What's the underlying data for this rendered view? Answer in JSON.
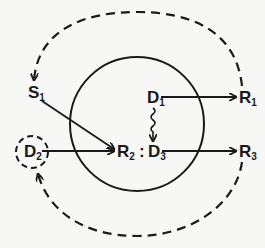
{
  "diagram": {
    "nodes": [
      {
        "id": "S1",
        "letter": "S",
        "sub": "1"
      },
      {
        "id": "D1",
        "letter": "D",
        "sub": "1"
      },
      {
        "id": "R1",
        "letter": "R",
        "sub": "1"
      },
      {
        "id": "D2",
        "letter": "D",
        "sub": "2"
      },
      {
        "id": "R2",
        "letter": "R",
        "sub": "2"
      },
      {
        "id": "D3",
        "letter": "D",
        "sub": "3"
      },
      {
        "id": "R3",
        "letter": "R",
        "sub": "3"
      }
    ],
    "separator": ":",
    "edges": [
      {
        "from": "S1",
        "to": "R2",
        "style": "solid",
        "arrow": true
      },
      {
        "from": "D1",
        "to": "R1",
        "style": "solid",
        "arrow": true
      },
      {
        "from": "D1",
        "to": "D3",
        "style": "wavy",
        "arrow": true
      },
      {
        "from": "D2",
        "to": "R2",
        "style": "solid",
        "arrow": true
      },
      {
        "from": "D3",
        "to": "R3",
        "style": "solid",
        "arrow": true
      },
      {
        "from": "R1",
        "to": "S1",
        "style": "dashed-arc",
        "arrow": true
      },
      {
        "from": "R3",
        "to": "D2",
        "style": "dashed-arc",
        "arrow": true
      }
    ],
    "shapes": [
      {
        "type": "circle",
        "style": "solid",
        "encloses": [
          "D1",
          "R2",
          "D3"
        ]
      },
      {
        "type": "circle",
        "style": "dashed",
        "encloses": [
          "D2"
        ]
      }
    ]
  },
  "colors": {
    "ink": "#1a1a1a",
    "background": "#f7f7f5"
  }
}
